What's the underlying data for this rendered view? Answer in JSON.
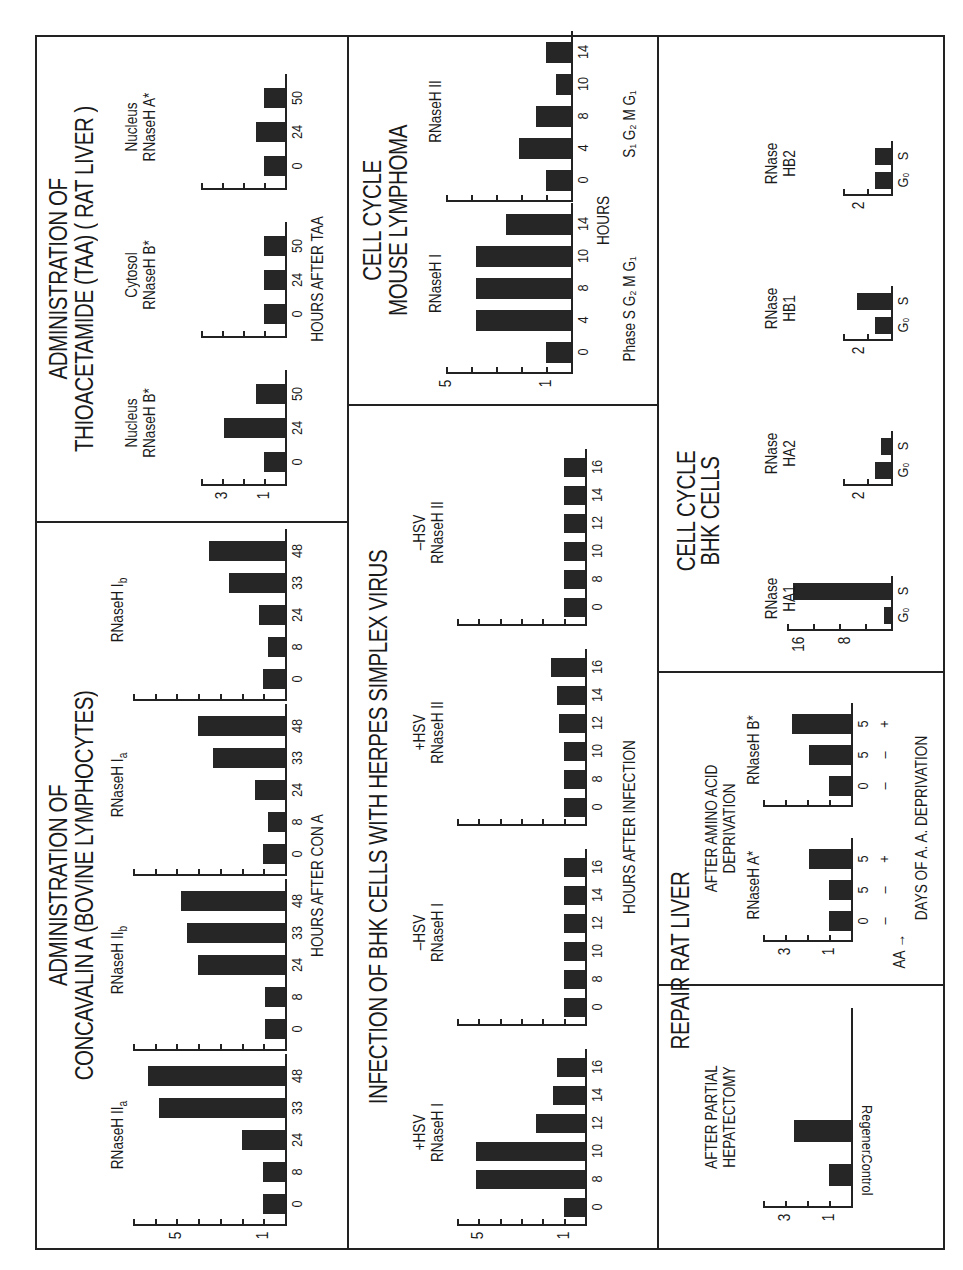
{
  "panels": {
    "con_a": {
      "title_line1": "ADMINISTRATION OF",
      "title_line2": "CONCAVALIN A (BOVINE LYMPHOCYTES)",
      "x_axis_title": "HOURS AFTER CON A",
      "y_ticks": [
        "5",
        "1"
      ]
    },
    "taa": {
      "title_line1": "ADMINISTRATION OF",
      "title_line2": "THIOACETAMIDE (TAA) ( RAT LIVER )",
      "x_axis_title": "HOURS AFTER TAA",
      "y_ticks": [
        "3",
        "1"
      ]
    },
    "hsv": {
      "title": "INFECTION OF BHK CELLS WITH HERPES SIMPLEX VIRUS",
      "x_axis_title": "HOURS AFTER INFECTION",
      "y_ticks": [
        "5",
        "1"
      ]
    },
    "lymphoma": {
      "title_line1": "CELL CYCLE",
      "title_line2": "MOUSE LYMPHOMA",
      "x_axis_title": "HOURS",
      "phase_label_1": "Phase S G₂ M G₁",
      "phase_label_2": "S₁ G₂ M G₁",
      "y_ticks": [
        "5",
        "1"
      ]
    },
    "repair": {
      "title": "REPAIR RAT LIVER",
      "hepatectomy_line1": "AFTER PARTIAL",
      "hepatectomy_line2": "HEPATECTOMY",
      "aa_line1": "AFTER AMINO ACID",
      "aa_line2": "DEPRIVATION",
      "aa_row_label": "AA →",
      "aa_signs": [
        "–",
        "+",
        "–",
        "+"
      ],
      "x_axis_title": "DAYS OF A. A. DEPRIVATION",
      "y_ticks": [
        "3",
        "1"
      ]
    },
    "bhk": {
      "title_line1": "CELL CYCLE",
      "title_line2": "BHK CELLS",
      "y_ticks_ha1": [
        "16",
        "8"
      ],
      "y_tick_small": "2"
    }
  },
  "chart_data": [
    {
      "type": "bar",
      "title": "Administration of Concavalin A (Bovine Lymphocytes)",
      "xlabel": "HOURS AFTER CON A",
      "ylabel": "Relative activity",
      "ylim": [
        0,
        7
      ],
      "categories": [
        "0",
        "8",
        "24",
        "33",
        "48"
      ],
      "series": [
        {
          "name": "RNaseH IIa",
          "label_main": "RNaseH II",
          "label_sub": "a",
          "values": [
            1.0,
            1.0,
            2.0,
            5.8,
            6.3
          ]
        },
        {
          "name": "RNaseH IIb",
          "label_main": "RNaseH II",
          "label_sub": "b",
          "values": [
            0.9,
            0.9,
            4.0,
            4.5,
            4.8
          ]
        },
        {
          "name": "RNaseH Ia",
          "label_main": "RNaseH I",
          "label_sub": "a",
          "values": [
            1.0,
            0.8,
            1.4,
            3.3,
            4.0
          ]
        },
        {
          "name": "RNaseH Ib",
          "label_main": "RNaseH I",
          "label_sub": "b",
          "values": [
            1.0,
            0.8,
            1.2,
            2.6,
            3.5
          ]
        }
      ]
    },
    {
      "type": "bar",
      "title": "Administration of Thioacetamide (TAA) (Rat Liver)",
      "xlabel": "HOURS AFTER TAA",
      "ylim": [
        0,
        4
      ],
      "categories": [
        "0",
        "24",
        "50"
      ],
      "series": [
        {
          "name": "Nucleus RNaseH B*",
          "label_top": "Nucleus",
          "label_main": "RNaseH B*",
          "values": [
            1.0,
            2.9,
            1.4
          ]
        },
        {
          "name": "Cytosol RNaseH B*",
          "label_top": "Cytosol",
          "label_main": "RNaseH B*",
          "values": [
            1.0,
            1.0,
            1.0
          ]
        },
        {
          "name": "Nucleus RNaseH A*",
          "label_top": "Nucleus",
          "label_main": "RNaseH A*",
          "values": [
            1.0,
            1.4,
            1.0
          ]
        }
      ]
    },
    {
      "type": "bar",
      "title": "Infection of BHK Cells with Herpes Simplex Virus",
      "xlabel": "HOURS AFTER INFECTION",
      "ylim": [
        0,
        6
      ],
      "categories": [
        "0",
        "8",
        "10",
        "12",
        "14",
        "16"
      ],
      "series": [
        {
          "name": "+HSV RNaseH I",
          "label_top": "+HSV",
          "label_main": "RNaseH I",
          "values": [
            1.0,
            5.1,
            5.1,
            2.3,
            1.5,
            1.3
          ]
        },
        {
          "name": "-HSV RNaseH I",
          "label_top": "–HSV",
          "label_main": "RNaseH I",
          "values": [
            1.0,
            1.0,
            1.0,
            1.0,
            1.0,
            1.0
          ]
        },
        {
          "name": "+HSV RNaseH II",
          "label_top": "+HSV",
          "label_main": "RNaseH II",
          "values": [
            1.0,
            1.0,
            1.0,
            1.2,
            1.3,
            1.6
          ]
        },
        {
          "name": "-HSV RNaseH II",
          "label_top": "–HSV",
          "label_main": "RNaseH II",
          "values": [
            1.0,
            1.0,
            1.0,
            1.0,
            1.0,
            1.0
          ]
        }
      ]
    },
    {
      "type": "bar",
      "title": "Cell Cycle Mouse Lymphoma",
      "xlabel": "HOURS",
      "ylim": [
        0,
        5
      ],
      "categories": [
        "0",
        "4",
        "8",
        "10",
        "14"
      ],
      "series": [
        {
          "name": "RNaseH I",
          "label_main": "RNaseH I",
          "values": [
            1.0,
            3.8,
            3.8,
            3.8,
            2.6
          ]
        },
        {
          "name": "RNaseH II",
          "label_main": "RNaseH II",
          "values": [
            1.0,
            2.1,
            1.4,
            0.6,
            1.0
          ]
        }
      ]
    },
    {
      "type": "bar",
      "title": "Repair Rat Liver - After Partial Hepatectomy",
      "ylim": [
        0,
        4
      ],
      "categories": [
        "Control",
        "Regener."
      ],
      "values": [
        1.0,
        2.6
      ]
    },
    {
      "type": "bar",
      "title": "Repair Rat Liver - After Amino Acid Deprivation",
      "xlabel": "DAYS OF A. A. DEPRIVATION",
      "ylim": [
        0,
        4
      ],
      "categories": [
        "0",
        "5",
        "5"
      ],
      "aa": [
        "–",
        "–",
        "+"
      ],
      "series": [
        {
          "name": "RNaseH A*",
          "label_main": "RNaseH A*",
          "values": [
            1.0,
            1.0,
            1.9
          ]
        },
        {
          "name": "RNaseH B*",
          "label_main": "RNaseH B*",
          "values": [
            1.0,
            1.9,
            2.7
          ]
        }
      ]
    },
    {
      "type": "bar",
      "title": "Cell Cycle BHK Cells",
      "categories": [
        "G₀",
        "S"
      ],
      "series": [
        {
          "name": "RNase HA1",
          "label_top": "RNase",
          "label_main": "HA1",
          "ylim": [
            0,
            18
          ],
          "values": [
            1.2,
            17.0
          ]
        },
        {
          "name": "RNase HA2",
          "label_top": "RNase",
          "label_main": "HA2",
          "ylim": [
            0,
            3
          ],
          "values": [
            1.0,
            0.6
          ]
        },
        {
          "name": "RNase HB1",
          "label_top": "RNase",
          "label_main": "HB1",
          "ylim": [
            0,
            3
          ],
          "values": [
            1.0,
            2.1
          ]
        },
        {
          "name": "RNase HB2",
          "label_top": "RNase",
          "label_main": "HB2",
          "ylim": [
            0,
            3
          ],
          "values": [
            1.0,
            1.0
          ]
        }
      ]
    }
  ]
}
